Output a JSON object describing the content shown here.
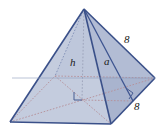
{
  "figure": {
    "name": "square-pyramid-diagram",
    "shape": "square pyramid",
    "background_color": "#ffffff",
    "colors": {
      "outline": "#4a5f96",
      "outline_dark": "#2f4479",
      "face_left": "#c3cbdd",
      "face_front_right": "#aab5cf",
      "face_base": "#dde6ef",
      "face_base_right": "#c8d2e2",
      "hidden_line": "#b08a92",
      "label_text": "#1a1a1a"
    },
    "labels": {
      "height": "h",
      "slant_height": "a",
      "lateral_edge_length": "8",
      "base_edge_length": "8"
    },
    "markers": {
      "base_center_right_angle": "right-angle-marker",
      "right_face_right_angle": "right-angle-marker"
    }
  }
}
